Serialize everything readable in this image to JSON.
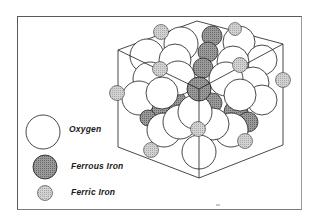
{
  "figure": {
    "legend": [
      {
        "key": "oxygen",
        "label": "Oxygen",
        "fill": "#ffffff",
        "stroke": "#1a1a1a",
        "size": "large"
      },
      {
        "key": "ferrous",
        "label": "Ferrous Iron",
        "fill": "#8c8c8c",
        "stroke": "#1a1a1a",
        "size": "medium"
      },
      {
        "key": "ferric",
        "label": "Ferric Iron",
        "fill": "#c4c4c4",
        "stroke": "#3a3a3a",
        "size": "small"
      }
    ]
  },
  "colors": {
    "frame": "#5a5a5a",
    "line": "#1a1a1a",
    "oxygen_fill": "#ffffff",
    "ferrous_fill": "#8c8c8c",
    "ferric_fill": "#c4c4c4"
  }
}
